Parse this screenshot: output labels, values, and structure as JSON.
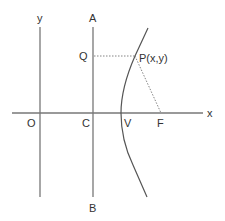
{
  "diagram": {
    "type": "geometry-hyperbola-directrix",
    "labels": {
      "y_axis": "y",
      "x_axis": "x",
      "origin": "O",
      "directrix_top": "A",
      "directrix_bottom": "B",
      "directrix_foot": "C",
      "vertex": "V",
      "focus": "F",
      "foot_on_directrix": "Q",
      "point": "P(x,y)"
    },
    "colors": {
      "line": "#777777",
      "curve": "#555555",
      "text": "#333333"
    }
  }
}
